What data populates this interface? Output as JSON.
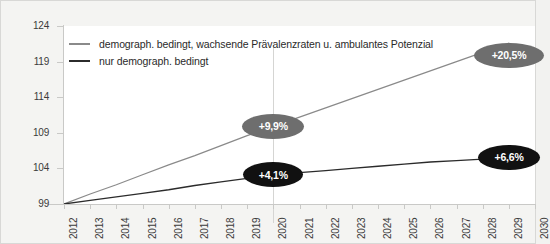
{
  "chart_data": {
    "type": "line",
    "title": "",
    "xlabel": "",
    "ylabel": "",
    "x": [
      2012,
      2013,
      2014,
      2015,
      2016,
      2017,
      2018,
      2019,
      2020,
      2021,
      2022,
      2023,
      2024,
      2025,
      2026,
      2027,
      2028,
      2029,
      2030
    ],
    "xticklabels": [
      "2012",
      "2013",
      "2014",
      "2015",
      "2016",
      "2017",
      "2018",
      "2019",
      "2020",
      "2021",
      "2022",
      "2023",
      "2024",
      "2025",
      "2026",
      "2027",
      "2028",
      "2029",
      "2030"
    ],
    "yticklabels": [
      "99",
      "104",
      "109",
      "114",
      "119",
      "124"
    ],
    "yticks": [
      99,
      104,
      109,
      114,
      119,
      124
    ],
    "ylim": [
      99,
      124
    ],
    "xlim": [
      2012,
      2030
    ],
    "grid": false,
    "legend_position": "top-left",
    "series": [
      {
        "name": "demograph. bedingt, wachsende Prävalenzraten u. ambulantes Potenzial",
        "color": "#8a8a8a",
        "values": [
          99.0,
          100.4,
          101.7,
          103.1,
          104.5,
          105.8,
          107.2,
          108.6,
          109.9,
          111.2,
          112.5,
          113.8,
          115.1,
          116.4,
          117.7,
          119.0,
          120.3,
          121.6,
          119.5
        ]
      },
      {
        "name": "nur demograph. bedingt",
        "color": "#2b2b2b",
        "values": [
          99.0,
          99.5,
          100.0,
          100.5,
          101.0,
          101.6,
          102.1,
          102.6,
          103.1,
          103.4,
          103.7,
          104.0,
          104.3,
          104.6,
          104.9,
          105.1,
          105.3,
          105.5,
          105.6
        ]
      }
    ],
    "annotations": [
      {
        "label": "+9,9%",
        "year": 2020,
        "series": "demograph. bedingt, wachsende Prävalenzraten u. ambulantes Potenzial",
        "fill": "#6e6e6e"
      },
      {
        "label": "+4,1%",
        "year": 2020,
        "series": "nur demograph. bedingt",
        "fill": "#111111"
      },
      {
        "label": "+20,5%",
        "year": 2030,
        "series": "demograph. bedingt, wachsende Prävalenzraten u. ambulantes Potenzial",
        "fill": "#6e6e6e"
      },
      {
        "label": "+6,6%",
        "year": 2030,
        "series": "nur demograph. bedingt",
        "fill": "#111111"
      }
    ],
    "marker_line_year": 2020
  },
  "legend": {
    "items": [
      {
        "label": "demograph. bedingt, wachsende Prävalenzraten u. ambulantes Potenzial"
      },
      {
        "label": "nur demograph. bedingt"
      }
    ]
  },
  "axis": {
    "y_labels": [
      "124",
      "119",
      "114",
      "109",
      "104",
      "99"
    ],
    "x_labels": [
      "2012",
      "2013",
      "2014",
      "2015",
      "2016",
      "2017",
      "2018",
      "2019",
      "2020",
      "2021",
      "2022",
      "2023",
      "2024",
      "2025",
      "2026",
      "2027",
      "2028",
      "2029",
      "2030"
    ]
  },
  "badges": {
    "gray_2020": "+9,9%",
    "black_2020": "+4,1%",
    "gray_2030": "+20,5%",
    "black_2030": "+6,6%"
  },
  "colors": {
    "series_light": "#8a8a8a",
    "series_dark": "#2b2b2b",
    "badge_gray": "#6e6e6e",
    "badge_black": "#111111",
    "background": "#f4f4f2",
    "plot_background": "#ffffff",
    "axis": "#c9c9c7"
  }
}
